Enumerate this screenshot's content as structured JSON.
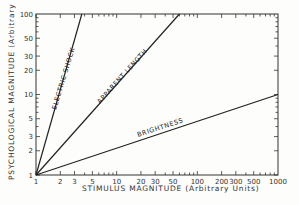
{
  "chart_data": {
    "type": "line",
    "title": "",
    "xlabel": "STIMULUS MAGNITUDE (Arbitrary Units)",
    "ylabel": "PSYCHOLOGICAL MAGNITUDE (Arbitrary Units)",
    "xscale": "log",
    "yscale": "log",
    "xlim": [
      1,
      1000
    ],
    "ylim": [
      1,
      100
    ],
    "grid": false,
    "legend": "none (curves labeled inline)",
    "x_tick_labels": [
      "1",
      "2",
      "3",
      "5",
      "10",
      "20",
      "30",
      "50",
      "100",
      "200",
      "300",
      "500",
      "1000"
    ],
    "y_tick_labels": [
      "1",
      "2",
      "3",
      "5",
      "10",
      "20",
      "30",
      "50",
      "100"
    ],
    "series": [
      {
        "name": "ELECTRIC SHOCK",
        "exponent": 3.5,
        "x": [
          1,
          3.7
        ],
        "y": [
          1,
          100
        ]
      },
      {
        "name": "APPARENT LENGTH",
        "exponent": 1.1,
        "x": [
          1,
          60
        ],
        "y": [
          1,
          100
        ]
      },
      {
        "name": "BRIGHTNESS",
        "exponent": 0.33,
        "x": [
          1,
          1000
        ],
        "y": [
          1,
          10
        ]
      }
    ]
  },
  "labels": {
    "x_axis_title": "STIMULUS  MAGNITUDE   (Arbitrary Units)",
    "y_axis_title": "PSYCHOLOGICAL  MAGNITUDE   (Arbitrary Units)",
    "electric_shock": "ELECTRIC SHOCK",
    "apparent_length": "APPARENT LENGTH",
    "brightness": "BRIGHTNESS"
  }
}
